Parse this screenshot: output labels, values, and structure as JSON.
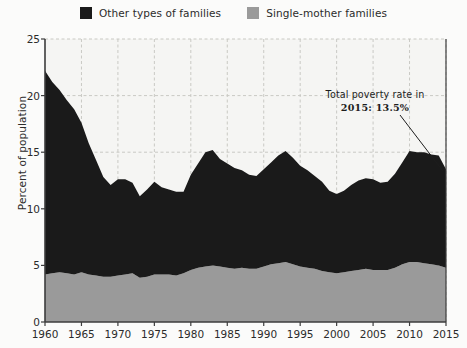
{
  "legend": {
    "items": [
      {
        "label": "Other types of families",
        "color": "#1a1a1a",
        "key": "other"
      },
      {
        "label": "Single-mother families",
        "color": "#9a9a9a",
        "key": "single_mother"
      }
    ]
  },
  "annotation": {
    "line1": "Total poverty rate in",
    "line2": "2015: 13.5%"
  },
  "axes": {
    "y_title": "Percent of population",
    "y_ticks": [
      "0",
      "5",
      "10",
      "15",
      "20",
      "25"
    ],
    "x_ticks": [
      "1960",
      "1965",
      "1970",
      "1975",
      "1980",
      "1985",
      "1990",
      "1995",
      "2000",
      "2005",
      "2010",
      "2015"
    ]
  },
  "colors": {
    "other_families": "#1a1a1a",
    "single_mother": "#9a9a9a",
    "page_background": "#fbfbfa",
    "plot_background": "#f5f5f3",
    "gridline": "#c9c9c4",
    "axis": "#3d3d3d",
    "text": "#2b2b2b"
  },
  "chart_data": {
    "type": "area",
    "stacked": true,
    "title": "",
    "xlabel": "",
    "ylabel": "Percent of population",
    "xlim": [
      1960,
      2015
    ],
    "ylim": [
      0,
      25
    ],
    "y_tick_values": [
      0,
      5,
      10,
      15,
      20,
      25
    ],
    "x_tick_values": [
      1960,
      1965,
      1970,
      1975,
      1980,
      1985,
      1990,
      1995,
      2000,
      2005,
      2010,
      2015
    ],
    "grid": true,
    "legend_position": "top-center",
    "annotations": [
      {
        "text": "Total poverty rate in 2015: 13.5%",
        "points_to_year": 2015,
        "points_to_value": 13.5
      }
    ],
    "x": [
      1960,
      1961,
      1962,
      1963,
      1964,
      1965,
      1966,
      1967,
      1968,
      1969,
      1970,
      1971,
      1972,
      1973,
      1974,
      1975,
      1976,
      1977,
      1978,
      1979,
      1980,
      1981,
      1982,
      1983,
      1984,
      1985,
      1986,
      1987,
      1988,
      1989,
      1990,
      1991,
      1992,
      1993,
      1994,
      1995,
      1996,
      1997,
      1998,
      1999,
      2000,
      2001,
      2002,
      2003,
      2004,
      2005,
      2006,
      2007,
      2008,
      2009,
      2010,
      2011,
      2012,
      2013,
      2014,
      2015
    ],
    "series": [
      {
        "name": "Single-mother families",
        "color": "#9a9a9a",
        "values": [
          4.2,
          4.3,
          4.4,
          4.3,
          4.2,
          4.4,
          4.2,
          4.1,
          4.0,
          4.0,
          4.1,
          4.2,
          4.3,
          3.9,
          4.0,
          4.2,
          4.2,
          4.2,
          4.1,
          4.3,
          4.6,
          4.8,
          4.9,
          5.0,
          4.9,
          4.8,
          4.7,
          4.8,
          4.7,
          4.7,
          4.9,
          5.1,
          5.2,
          5.3,
          5.1,
          4.9,
          4.8,
          4.7,
          4.5,
          4.4,
          4.3,
          4.4,
          4.5,
          4.6,
          4.7,
          4.6,
          4.6,
          4.6,
          4.8,
          5.1,
          5.3,
          5.3,
          5.2,
          5.1,
          5.0,
          4.8
        ]
      },
      {
        "name": "Other types of families",
        "color": "#1a1a1a",
        "values": [
          18.0,
          16.9,
          16.1,
          15.3,
          14.6,
          13.2,
          11.6,
          10.2,
          8.8,
          8.1,
          8.5,
          8.4,
          8.0,
          7.2,
          7.7,
          8.2,
          7.7,
          7.5,
          7.4,
          7.2,
          8.4,
          9.2,
          10.1,
          10.2,
          9.5,
          9.2,
          8.9,
          8.6,
          8.3,
          8.2,
          8.6,
          9.0,
          9.5,
          9.8,
          9.4,
          8.9,
          8.6,
          8.2,
          7.9,
          7.2,
          7.0,
          7.2,
          7.6,
          7.9,
          8.0,
          8.0,
          7.7,
          7.8,
          8.3,
          9.0,
          9.8,
          9.7,
          9.8,
          9.7,
          9.7,
          8.7
        ]
      }
    ],
    "totals": [
      22.2,
      21.2,
      20.5,
      19.6,
      18.8,
      17.6,
      15.8,
      14.3,
      12.8,
      12.1,
      12.6,
      12.6,
      12.3,
      11.1,
      11.7,
      12.4,
      11.9,
      11.7,
      11.5,
      11.5,
      13.0,
      14.0,
      15.0,
      15.2,
      14.4,
      14.0,
      13.6,
      13.4,
      13.0,
      12.9,
      13.5,
      14.1,
      14.7,
      15.1,
      14.5,
      13.8,
      13.4,
      12.9,
      12.4,
      11.6,
      11.3,
      11.6,
      12.1,
      12.5,
      12.7,
      12.6,
      12.3,
      12.4,
      13.1,
      14.1,
      15.1,
      15.0,
      15.0,
      14.8,
      14.7,
      13.5
    ]
  }
}
